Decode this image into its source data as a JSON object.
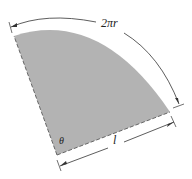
{
  "figure": {
    "type": "sector-development-diagram",
    "labels": {
      "arc_length": "2πr",
      "slant_length": "l",
      "angle": "θ"
    },
    "colors": {
      "sector_fill": "#b3b3b3",
      "edge_stroke": "#555555",
      "dimension_stroke": "#333333",
      "background": "#ffffff"
    }
  }
}
